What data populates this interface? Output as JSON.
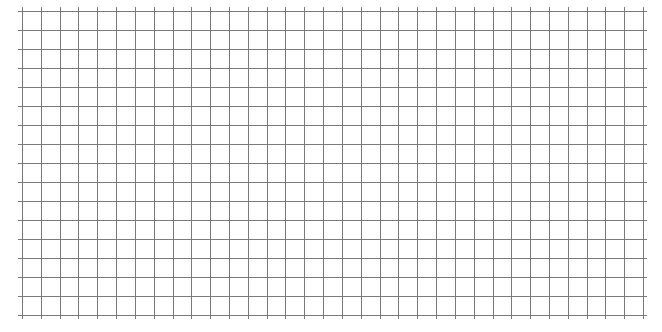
{
  "grid": {
    "background": "#ffffff",
    "line_color": "#7a7a7a",
    "line_width": 1,
    "origin_x": 22,
    "origin_y": 11,
    "columns": 33,
    "rows": 16,
    "cell_width": 18.82,
    "cell_height": 19,
    "overhang": 4
  }
}
